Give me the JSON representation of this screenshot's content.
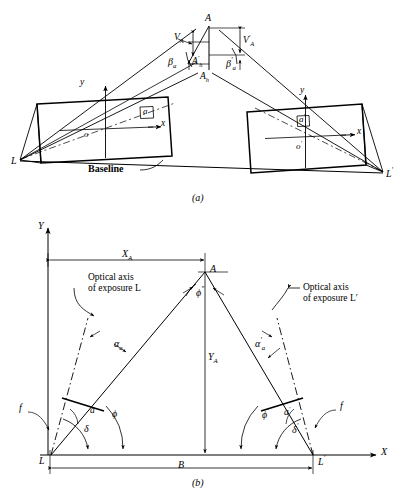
{
  "figure": {
    "captions": {
      "top": "(a)",
      "bottom": "(b)"
    },
    "line_color": "#000000",
    "background": "#ffffff"
  },
  "panel_a": {
    "caption": "(a)",
    "description": "Oblique perspective view of two tilted photographs and object point A",
    "labels": {
      "object_point": "A",
      "horizontal_point": "A",
      "horizontal_point_sub": "h",
      "horizontal_point_prime": "A",
      "horizontal_point_prime_sub": "h",
      "vertical_left": "V",
      "vertical_left_sub": "A",
      "vertical_right": "V",
      "vertical_right_sub": "A",
      "beta_left": "β",
      "beta_left_sub": "a",
      "beta_right": "β",
      "beta_right_sub": "a",
      "station_left": "L",
      "station_right": "L",
      "principal_point_left": "o",
      "principal_point_right": "o",
      "image_point_left": "a",
      "image_point_right": "a",
      "axis_x_left": "x",
      "axis_y_left": "y",
      "axis_x_right": "x",
      "axis_y_right": "y",
      "baseline": "Baseline"
    }
  },
  "panel_b": {
    "caption": "(b)",
    "description": "Plan view of the horizontal control triangle L-A-L'",
    "labels": {
      "axis_X": "X",
      "axis_Y": "Y",
      "object_point": "A",
      "station_left": "L",
      "station_right": "L",
      "dim_XA": "X",
      "dim_XA_sub": "A",
      "dim_YA": "Y",
      "dim_YA_sub": "A",
      "dim_B": "B",
      "apex_angle": "ϕ",
      "apex_angle_sup": "″",
      "alpha_left": "α",
      "alpha_left_sub": "a",
      "alpha_right": "α",
      "alpha_right_sub": "a",
      "phi_left": "ϕ",
      "phi_right": "ϕ",
      "a_left": "a",
      "a_right": "a",
      "delta_left": "δ",
      "delta_right": "δ",
      "focal_left": "f",
      "focal_right": "f",
      "note_left_line1": "Optical axis",
      "note_left_line2": "of exposure L",
      "note_right_line1": "Optical axis",
      "note_right_line2": "of exposure L′"
    }
  }
}
